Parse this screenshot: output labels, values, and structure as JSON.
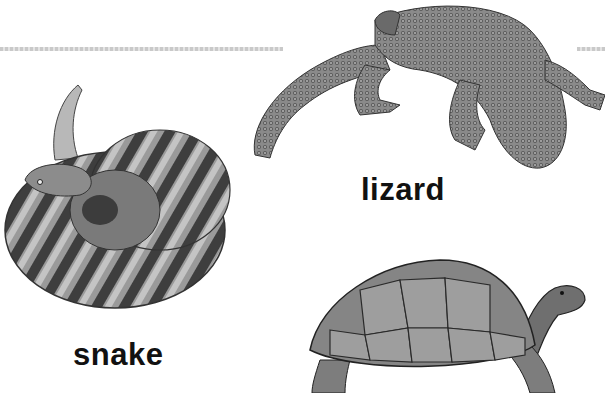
{
  "labels": {
    "lizard": "lizard",
    "snake": "snake"
  },
  "animals": [
    {
      "name": "lizard",
      "kind": "gila-monster-illustration"
    },
    {
      "name": "snake",
      "kind": "coiled-rattlesnake-illustration"
    },
    {
      "name": "tortoise",
      "kind": "tortoise-illustration"
    }
  ],
  "colors": {
    "background": "#ffffff",
    "text": "#111111",
    "divider": "#c9c9c9"
  }
}
